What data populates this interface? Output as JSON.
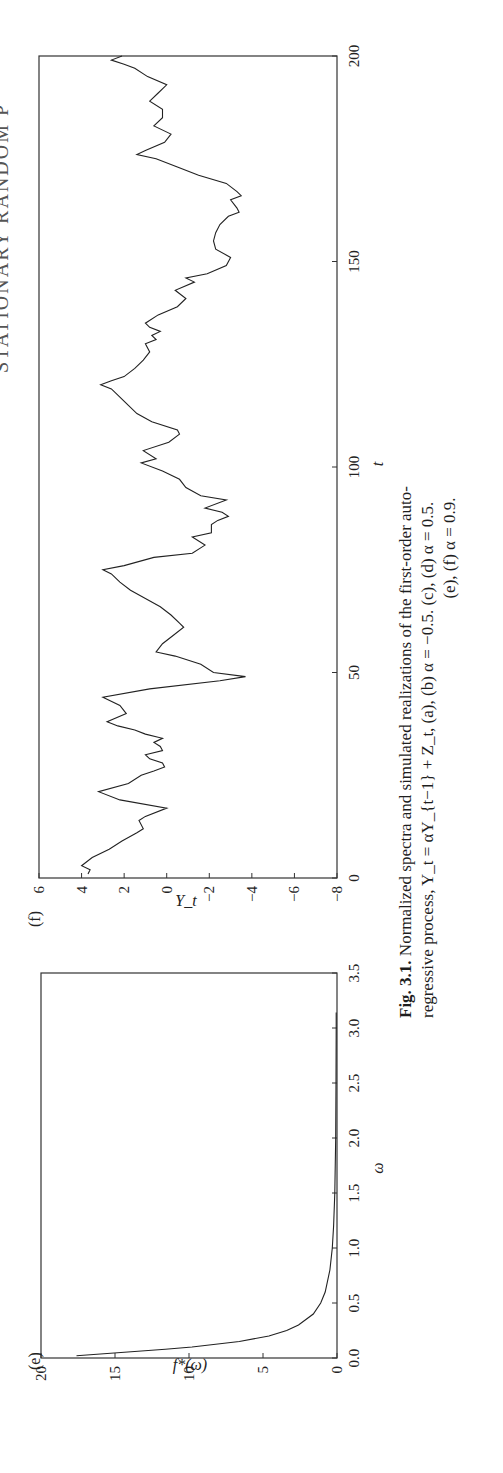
{
  "running_header": "STATIONARY RANDOM P",
  "figure": {
    "number": "Fig. 3.1.",
    "caption_line1": "Normalized spectra and simulated realizations of the first-order auto-",
    "caption_line2": "regressive process,   Y_t = αY_{t−1} + Z_t,   (a),   (b)   α = −0.5.   (c),   (d)   α = 0.5.",
    "caption_line3": "(e), (f) α = 0.9."
  },
  "panel_e": {
    "label": "(e)",
    "xlabel": "ω",
    "ylabel": "f*(ω)"
  },
  "panel_f": {
    "label": "(f)",
    "xlabel": "t",
    "ylabel": "Y_t"
  },
  "chart_data": [
    {
      "panel": "(e)",
      "type": "line",
      "title": "",
      "xlabel": "ω",
      "ylabel": "f*(ω)",
      "xlim": [
        0.0,
        3.5
      ],
      "ylim": [
        0,
        20
      ],
      "xticks": [
        "0.0",
        "0.5",
        "1.0",
        "1.5",
        "2.0",
        "2.5",
        "3.0",
        "3.5"
      ],
      "yticks": [
        "0",
        "5",
        "10",
        "15",
        "20"
      ],
      "grid": false,
      "legend": null,
      "series": [
        {
          "name": "normalized spectrum α=0.9",
          "x": [
            0.02,
            0.05,
            0.08,
            0.1,
            0.15,
            0.2,
            0.25,
            0.3,
            0.4,
            0.5,
            0.6,
            0.8,
            1.0,
            1.2,
            1.5,
            2.0,
            2.5,
            3.0,
            3.14
          ],
          "values": [
            17.6,
            14.6,
            11.6,
            9.8,
            6.6,
            4.6,
            3.4,
            2.6,
            1.6,
            1.1,
            0.8,
            0.48,
            0.32,
            0.23,
            0.15,
            0.09,
            0.065,
            0.055,
            0.053
          ]
        }
      ]
    },
    {
      "panel": "(f)",
      "type": "line",
      "title": "",
      "xlabel": "t",
      "ylabel": "Y_t",
      "xlim": [
        0,
        200
      ],
      "ylim": [
        -8,
        6
      ],
      "xticks": [
        "0",
        "50",
        "100",
        "150",
        "200"
      ],
      "yticks": [
        "6",
        "4",
        "2",
        "0",
        "−2",
        "−4",
        "−6",
        "−8"
      ],
      "grid": false,
      "legend": null,
      "series": [
        {
          "name": "simulated realization α=0.9",
          "x": [
            1,
            2,
            3,
            5,
            7,
            9,
            11,
            12,
            14,
            15,
            17,
            19,
            21,
            23,
            25,
            26,
            27,
            28,
            29,
            30,
            31,
            32,
            33,
            34,
            35,
            36,
            37,
            38,
            40,
            42,
            44,
            46,
            48,
            49,
            50,
            52,
            54,
            55,
            57,
            59,
            61,
            62,
            64,
            66,
            68,
            70,
            72,
            74,
            75,
            76,
            78,
            79,
            81,
            83,
            84,
            86,
            87,
            88,
            89,
            90,
            92,
            93,
            95,
            97,
            99,
            101,
            102,
            104,
            106,
            108,
            109,
            111,
            113,
            115,
            117,
            119,
            120,
            121,
            122,
            124,
            126,
            128,
            130,
            131,
            132,
            133,
            134,
            135,
            137,
            139,
            141,
            143,
            145,
            146,
            147,
            149,
            151,
            153,
            155,
            157,
            159,
            161,
            162,
            163,
            165,
            166,
            167,
            169,
            171,
            173,
            175,
            176,
            177,
            179,
            181,
            183,
            185,
            187,
            189,
            191,
            193,
            195,
            197,
            198,
            199,
            200
          ],
          "values": [
            3.7,
            3.6,
            4.0,
            3.5,
            2.7,
            2.1,
            1.4,
            1.1,
            1.3,
            1.0,
            0.0,
            2.2,
            3.2,
            1.8,
            1.2,
            0.6,
            0.1,
            0.2,
            0.8,
            1.0,
            0.2,
            0.3,
            0.6,
            0.2,
            1.0,
            1.5,
            2.3,
            2.8,
            1.9,
            2.2,
            3.0,
            0.8,
            -2.5,
            -3.7,
            -2.2,
            -1.6,
            -0.4,
            0.5,
            0.2,
            -0.3,
            -0.8,
            -0.6,
            -0.2,
            0.3,
            1.0,
            1.7,
            2.2,
            2.6,
            3.0,
            2.0,
            0.6,
            -1.2,
            -1.8,
            -1.2,
            -2.1,
            -2.1,
            -2.4,
            -2.9,
            -2.6,
            -1.8,
            -2.8,
            -1.6,
            -0.9,
            -0.6,
            0.2,
            1.2,
            0.5,
            1.1,
            -0.1,
            -0.6,
            -0.5,
            0.7,
            1.4,
            1.8,
            2.2,
            2.6,
            3.1,
            2.6,
            2.0,
            1.5,
            1.1,
            0.8,
            1.0,
            0.5,
            0.7,
            0.3,
            0.8,
            1.0,
            0.4,
            -0.5,
            -0.9,
            -0.4,
            -1.3,
            -0.9,
            -1.9,
            -2.8,
            -3.0,
            -2.3,
            -2.2,
            -2.3,
            -2.5,
            -2.9,
            -3.4,
            -3.3,
            -3.0,
            -3.5,
            -3.3,
            -2.8,
            -1.5,
            -0.5,
            0.5,
            1.4,
            1.0,
            0.1,
            -0.2,
            0.6,
            0.2,
            0.2,
            0.8,
            0.4,
            0.0,
            0.9,
            1.5,
            2.0,
            2.6,
            2.1
          ]
        }
      ]
    }
  ]
}
